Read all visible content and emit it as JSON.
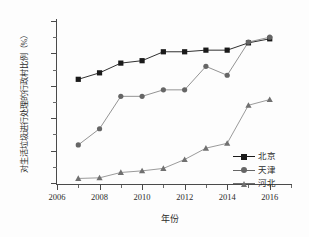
{
  "chart_data": {
    "type": "line",
    "title": "",
    "subtitle": "",
    "xlabel": "年份",
    "ylabel": "对生活垃圾进行处理的行政村比例（%）",
    "x": [
      2007,
      2008,
      2009,
      2010,
      2011,
      2012,
      2013,
      2014,
      2015,
      2016
    ],
    "xlim": [
      2006,
      2017
    ],
    "ylim": [
      0,
      100
    ],
    "xticks": [
      2006,
      2008,
      2010,
      2012,
      2014,
      2016
    ],
    "xtick_labels": [
      "2006",
      "2008",
      "2010",
      "2012",
      "2014",
      "2016"
    ],
    "xticks_minor": [
      2007,
      2009,
      2011,
      2013,
      2015,
      2017
    ],
    "yticks": [
      0,
      20,
      40,
      60,
      80,
      100
    ],
    "ytick_labels": [
      "0",
      "20",
      "40",
      "60",
      "80",
      "100"
    ],
    "yticks_minor": [
      10,
      30,
      50,
      70,
      90
    ],
    "grid": false,
    "legend_position": "bottom-right",
    "series": [
      {
        "name": "北京",
        "marker": "square",
        "color": "#1a1a1a",
        "values": [
          64,
          68,
          74,
          75.5,
          81,
          81,
          82,
          82,
          86.5,
          89
        ]
      },
      {
        "name": "天津",
        "marker": "circle",
        "color": "#666666",
        "values": [
          23.5,
          33.5,
          53.5,
          53.5,
          57.5,
          57.5,
          72,
          66.5,
          87,
          90
        ]
      },
      {
        "name": "河北",
        "marker": "triangle",
        "color": "#707070",
        "values": [
          2.8,
          3.2,
          6.5,
          7.5,
          9,
          14.5,
          21.5,
          24.5,
          48,
          51.5
        ]
      }
    ]
  },
  "legend": {
    "items": [
      {
        "label": "北京",
        "marker": "square"
      },
      {
        "label": "天津",
        "marker": "circle"
      },
      {
        "label": "河北",
        "marker": "triangle"
      }
    ]
  },
  "axes": {
    "x_title": "年份",
    "y_title": "对生活垃圾进行处理的行政村比例（%）"
  },
  "colors": {
    "beijing": "#1a1a1a",
    "tianjin": "#666666",
    "hebei": "#707070",
    "axis": "#4a4a4a",
    "background": "#fdfdfd"
  }
}
